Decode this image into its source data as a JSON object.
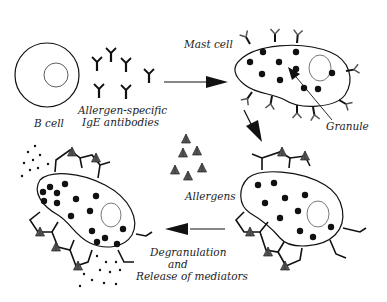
{
  "diagram": {
    "labels": {
      "b_cell": "B cell",
      "antibodies_line1": "Allergen-specific",
      "antibodies_line2": "IgE antibodies",
      "mast_cell": "Mast cell",
      "granule": "Granule",
      "allergens": "Allergens",
      "degranulation_line1": "Degranulation",
      "degranulation_line2": "and",
      "degranulation_line3": "Release of mediators"
    },
    "colors": {
      "line": "#111111",
      "allergen": "#555555",
      "background": "#ffffff"
    }
  }
}
